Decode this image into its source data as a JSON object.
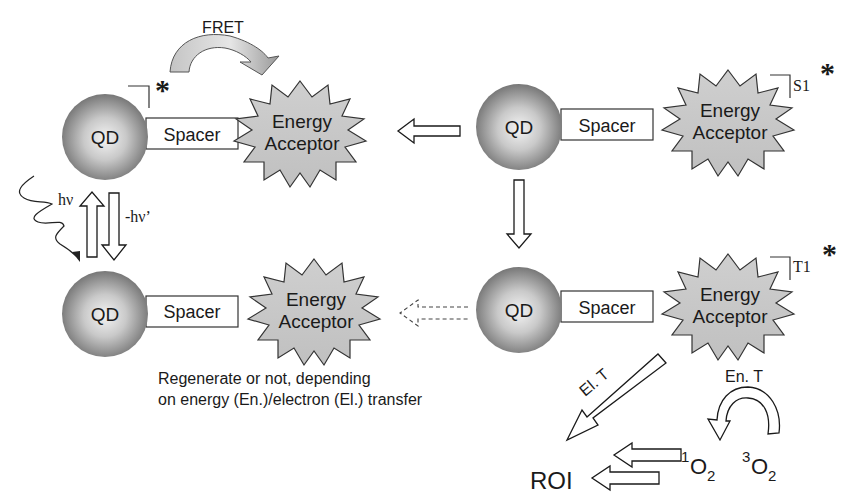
{
  "diagram": {
    "type": "QD-FRET photosensitization scheme",
    "colors": {
      "qd_edge": "#7a7a7a",
      "qd_center": "#f2f2f2",
      "acceptor_fill": "#c8c8c8",
      "outline": "#1a1a1a",
      "background": "#ffffff"
    },
    "top_left": {
      "qd": "QD",
      "spacer": "Spacer",
      "acceptor_line1": "Energy",
      "acceptor_line2": "Acceptor",
      "excited_marker": "*",
      "fret_label": "FRET"
    },
    "top_right": {
      "qd": "QD",
      "spacer": "Spacer",
      "acceptor_line1": "Energy",
      "acceptor_line2": "Acceptor",
      "state_label": "S1",
      "excited_marker": "*"
    },
    "bottom_left": {
      "qd": "QD",
      "spacer": "Spacer",
      "acceptor_line1": "Energy",
      "acceptor_line2": "Acceptor"
    },
    "bottom_right": {
      "qd": "QD",
      "spacer": "Spacer",
      "acceptor_line1": "Energy",
      "acceptor_line2": "Acceptor",
      "state_label": "T1",
      "excited_marker": "*"
    },
    "excitation": {
      "absorb_label": "hν",
      "emit_label": "-hν’"
    },
    "caption": {
      "line1": "Regenerate or not, depending",
      "line2": "on energy (En.)/electron (El.) transfer"
    },
    "transfer": {
      "electron_label": "El. T",
      "energy_label": "En. T"
    },
    "products": {
      "roi": "ROI",
      "singlet_sup": "1",
      "singlet_base": "O",
      "singlet_sub": "2",
      "triplet_sup": "3",
      "triplet_base": "O",
      "triplet_sub": "2"
    }
  }
}
